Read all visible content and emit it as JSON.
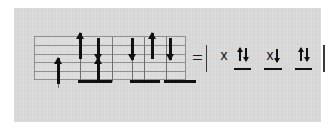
{
  "figure": {
    "kind": "orbital-occupancy-diagram",
    "background_color": "#d6d6d6",
    "page_color": "#ffffff",
    "ink_color": "#111111",
    "grid_line_color": "#8f8f8f"
  },
  "diagram": {
    "label": "energy-level grid with electron spin arrows",
    "grid": {
      "rows": 5,
      "horizontal_lines": 6,
      "columns_ticks": 4
    },
    "arrows": [
      {
        "id": "a1",
        "direction": "up",
        "column": 1,
        "level": "low"
      },
      {
        "id": "a2",
        "direction": "up",
        "column": 2,
        "level": "high"
      },
      {
        "id": "a3",
        "direction": "down",
        "column": 2,
        "level": "high"
      },
      {
        "id": "a4",
        "direction": "up",
        "column": 3,
        "level": "low"
      },
      {
        "id": "a5",
        "direction": "down",
        "column": 3,
        "level": "high"
      },
      {
        "id": "a6",
        "direction": "up",
        "column": 4,
        "level": "high"
      },
      {
        "id": "a7",
        "direction": "down",
        "column": 4,
        "level": "high"
      }
    ],
    "bars": [
      {
        "id": "b1",
        "column": 2
      },
      {
        "id": "b2",
        "column": 3
      },
      {
        "id": "b3",
        "column": 4
      }
    ]
  },
  "equation": {
    "operator": "=",
    "left_bracket": "|",
    "right_bracket": "|",
    "terms": [
      {
        "id": "t1",
        "label": "x",
        "arrows": [],
        "underlined": false
      },
      {
        "id": "t2",
        "label": "",
        "arrows": [
          "up",
          "down"
        ],
        "underlined": true
      },
      {
        "id": "t3",
        "label": "x",
        "arrows": [
          "down"
        ],
        "underlined": true
      },
      {
        "id": "t4",
        "label": "",
        "arrows": [
          "up",
          "down"
        ],
        "underlined": true
      }
    ],
    "plain_text": "= | x ↑↓  x↓  ↑↓ |"
  }
}
